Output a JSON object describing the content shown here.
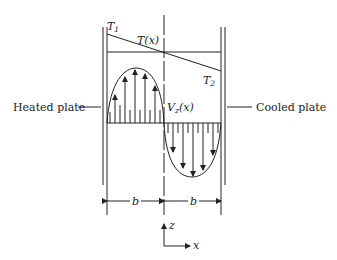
{
  "diagram": {
    "left_label": "Heated plate",
    "right_label": "Cooled plate",
    "T1": "T",
    "T1_sub": "1",
    "T2": "T",
    "T2_sub": "2",
    "Tx": "T(x)",
    "Vz": "V",
    "Vz_sub": "z",
    "Vz_arg": "(x)",
    "b_left": "b",
    "b_right": "b",
    "axis_z": "z",
    "axis_x": "x"
  }
}
